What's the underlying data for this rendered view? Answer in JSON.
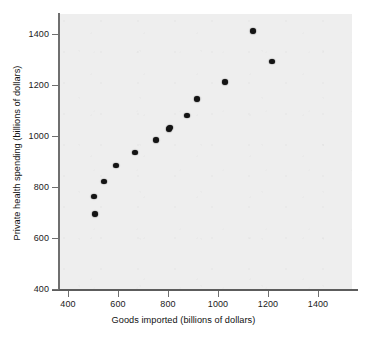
{
  "chart_data": {
    "type": "scatter",
    "title": "",
    "xlabel": "Goods imported (billions of dollars)",
    "ylabel": "Private health spending (billions of dollars)",
    "xlim": [
      340,
      1560
    ],
    "ylim": [
      370,
      1470
    ],
    "xticks": [
      400,
      600,
      800,
      1000,
      1200,
      1400
    ],
    "yticks": [
      400,
      600,
      800,
      1000,
      1200,
      1400
    ],
    "xtick_labels": [
      "400",
      "600",
      "800",
      "1000",
      "1200",
      "1400"
    ],
    "ytick_labels": [
      "400",
      "600",
      "800",
      "1000",
      "1200",
      "1400"
    ],
    "grid": false,
    "legend": false,
    "legend_position": "none",
    "marker": "filled-circle",
    "marker_color": "#141414",
    "panel_background": "#eeeeee",
    "figure_background": "#ffffff",
    "axis_color": "#6f6f6f",
    "x": [
      504,
      507,
      544,
      592,
      668,
      752,
      805,
      809,
      877,
      917,
      1029,
      1139,
      1217
    ],
    "y": [
      762,
      693,
      821,
      884,
      936,
      984,
      1027,
      1034,
      1080,
      1144,
      1211,
      1412,
      1292
    ],
    "points": [
      {
        "x": 504,
        "y": 762
      },
      {
        "x": 507,
        "y": 693
      },
      {
        "x": 544,
        "y": 821
      },
      {
        "x": 592,
        "y": 884
      },
      {
        "x": 668,
        "y": 936
      },
      {
        "x": 752,
        "y": 984
      },
      {
        "x": 805,
        "y": 1027
      },
      {
        "x": 809,
        "y": 1034
      },
      {
        "x": 877,
        "y": 1080
      },
      {
        "x": 917,
        "y": 1144
      },
      {
        "x": 1029,
        "y": 1211
      },
      {
        "x": 1139,
        "y": 1412
      },
      {
        "x": 1217,
        "y": 1292
      }
    ],
    "annotations": []
  }
}
